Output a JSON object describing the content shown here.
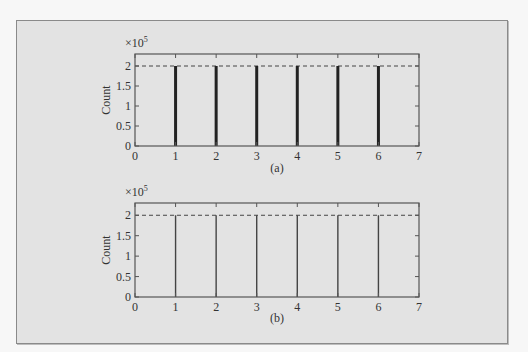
{
  "chart_data": [
    {
      "type": "bar",
      "style": "stem, thick lines",
      "caption": "(a)",
      "x": [
        1,
        2,
        3,
        4,
        5,
        6
      ],
      "values": [
        200000,
        200000,
        200000,
        200000,
        200000,
        200000
      ],
      "reference_line": {
        "y": 200000,
        "style": "dashed"
      },
      "title": "",
      "xlabel": "",
      "ylabel": "Count",
      "y_multiplier": "×10^5",
      "xlim": [
        0,
        7
      ],
      "ylim": [
        0,
        2.3
      ],
      "xticks": [
        "0",
        "1",
        "2",
        "3",
        "4",
        "5",
        "6",
        "7"
      ],
      "yticks": [
        "0",
        "0.5",
        "1",
        "1.5",
        "2"
      ],
      "grid": false,
      "legend": null
    },
    {
      "type": "bar",
      "style": "stem, thin lines",
      "caption": "(b)",
      "x": [
        1,
        2,
        3,
        4,
        5,
        6
      ],
      "values": [
        200000,
        200000,
        200000,
        200000,
        200000,
        200000
      ],
      "reference_line": {
        "y": 200000,
        "style": "dashed"
      },
      "title": "",
      "xlabel": "",
      "ylabel": "Count",
      "y_multiplier": "×10^5",
      "xlim": [
        0,
        7
      ],
      "ylim": [
        0,
        2.3
      ],
      "xticks": [
        "0",
        "1",
        "2",
        "3",
        "4",
        "5",
        "6",
        "7"
      ],
      "yticks": [
        "0",
        "0.5",
        "1",
        "1.5",
        "2"
      ],
      "grid": false,
      "legend": null
    }
  ],
  "labels": {
    "multiplier_base": "×10",
    "multiplier_exp": "5",
    "ylabel": "Count",
    "caption_a": "(a)",
    "caption_b": "(b)"
  }
}
